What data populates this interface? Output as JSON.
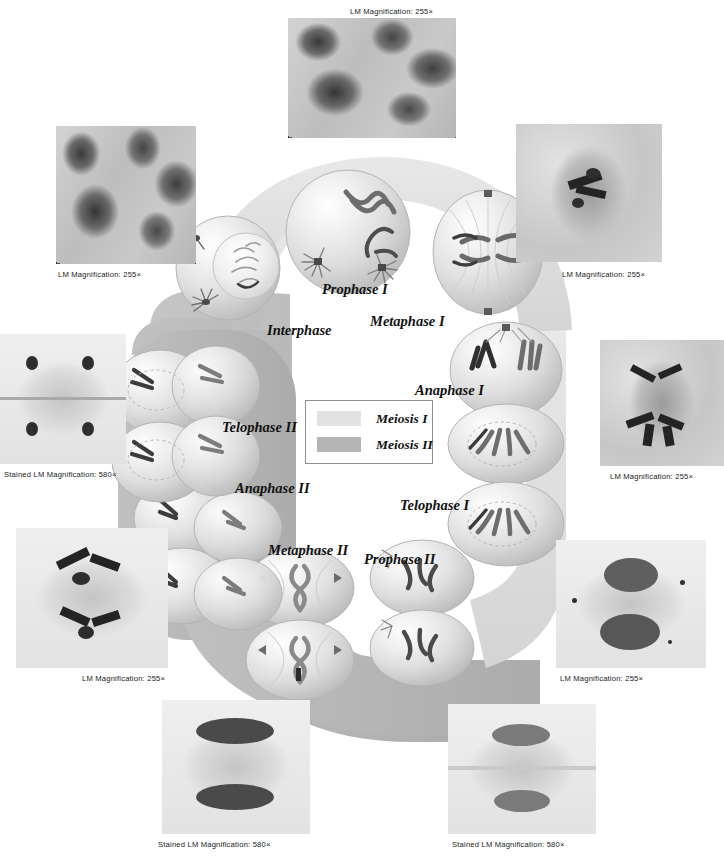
{
  "diagram": {
    "title": "Meiosis",
    "band_colors": {
      "meiosis_i": "#dedede",
      "meiosis_ii": "#b6b6b6"
    }
  },
  "legend": {
    "items": [
      {
        "label": "Meiosis I",
        "color": "#e2e2e2"
      },
      {
        "label": "Meiosis II",
        "color": "#b5b5b5"
      }
    ]
  },
  "phases": [
    {
      "id": "interphase",
      "label": "Interphase"
    },
    {
      "id": "prophase-1",
      "label": "Prophase I"
    },
    {
      "id": "metaphase-1",
      "label": "Metaphase I"
    },
    {
      "id": "anaphase-1",
      "label": "Anaphase I"
    },
    {
      "id": "telophase-1",
      "label": "Telophase I"
    },
    {
      "id": "prophase-2",
      "label": "Prophase II"
    },
    {
      "id": "metaphase-2",
      "label": "Metaphase II"
    },
    {
      "id": "anaphase-2",
      "label": "Anaphase II"
    },
    {
      "id": "telophase-2",
      "label": "Telophase II"
    }
  ],
  "micrographs": [
    {
      "id": "top",
      "caption": "LM  Magnification: 255×"
    },
    {
      "id": "upper-left",
      "caption": "LM  Magnification: 255×"
    },
    {
      "id": "upper-right",
      "caption": "LM  Magnification: 255×"
    },
    {
      "id": "right-mid",
      "caption": "LM  Magnification: 255×"
    },
    {
      "id": "right-lower",
      "caption": "LM  Magnification: 255×"
    },
    {
      "id": "left-upper",
      "caption": "Stained LM  Magnification: 580×"
    },
    {
      "id": "left-lower",
      "caption": "LM  Magnification: 255×"
    },
    {
      "id": "bottom-left",
      "caption": "Stained LM  Magnification: 580×"
    },
    {
      "id": "bottom-right",
      "caption": "Stained LM  Magnification: 580×"
    }
  ]
}
